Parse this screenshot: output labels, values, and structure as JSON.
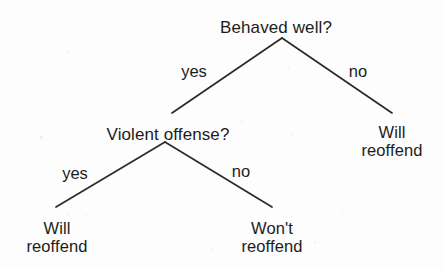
{
  "diagram": {
    "type": "decision-tree",
    "background_color": "#fdfdfd",
    "line_color": "#2b2b2b",
    "text_color": "#1c1c1c",
    "nodes": {
      "root": {
        "label": "Behaved well?",
        "kind": "decision",
        "x": 276,
        "y": 18
      },
      "violent": {
        "label": "Violent offense?",
        "kind": "decision",
        "x": 168,
        "y": 125
      },
      "leaf_right": {
        "line1": "Will",
        "line2": "reoffend",
        "kind": "outcome",
        "x": 392,
        "y": 124
      },
      "leaf_bottom_left": {
        "line1": "Will",
        "line2": "reoffend",
        "kind": "outcome",
        "x": 57,
        "y": 220
      },
      "leaf_bottom_right": {
        "line1": "Won't",
        "line2": "reoffend",
        "kind": "outcome",
        "x": 272,
        "y": 220
      }
    },
    "edges": [
      {
        "from": "root",
        "to": "violent",
        "label": "yes",
        "label_x": 194,
        "label_y": 62,
        "x1": 282,
        "y1": 38,
        "x2": 172,
        "y2": 113
      },
      {
        "from": "root",
        "to": "leaf_right",
        "label": "no",
        "label_x": 358,
        "label_y": 62,
        "x1": 282,
        "y1": 38,
        "x2": 392,
        "y2": 113
      },
      {
        "from": "violent",
        "to": "leaf_bottom_left",
        "label": "yes",
        "label_x": 75,
        "label_y": 164,
        "x1": 165,
        "y1": 142,
        "x2": 56,
        "y2": 207
      },
      {
        "from": "violent",
        "to": "leaf_bottom_right",
        "label": "no",
        "label_x": 241,
        "label_y": 162,
        "x1": 165,
        "y1": 142,
        "x2": 272,
        "y2": 207
      }
    ]
  }
}
